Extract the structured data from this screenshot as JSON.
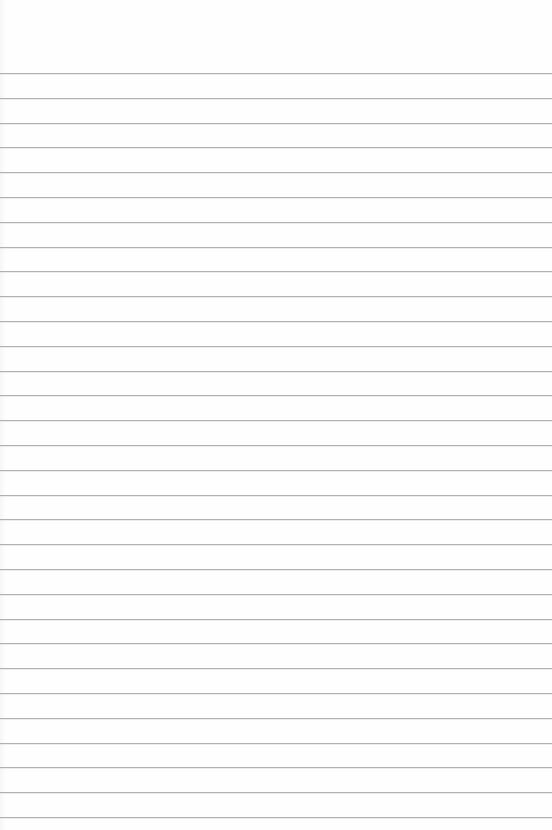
{
  "document": {
    "type": "lined-paper",
    "background_color": "#fefefe",
    "rule_color": "#a9a9a9",
    "first_rule_y": 73,
    "rule_spacing": 24.8,
    "rule_count": 31,
    "text_lines": []
  }
}
